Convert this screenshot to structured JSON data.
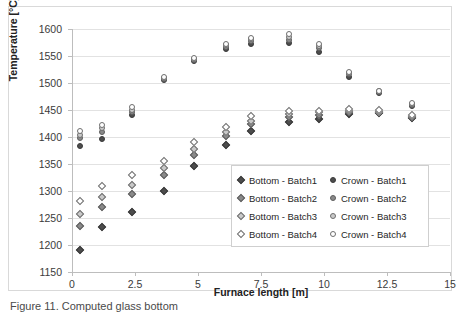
{
  "chart_data": {
    "type": "scatter",
    "title": "",
    "xlabel": "Furnace length [m]",
    "ylabel": "Temperature [°C]",
    "xlim": [
      0,
      15
    ],
    "ylim": [
      1150,
      1600
    ],
    "xticks": [
      "0",
      "2.5",
      "5",
      "7.5",
      "10",
      "12.5",
      "15"
    ],
    "xtick_values": [
      0,
      2.5,
      5,
      7.5,
      10,
      12.5,
      15
    ],
    "yticks": [
      "1150",
      "1200",
      "1250",
      "1300",
      "1350",
      "1400",
      "1450",
      "1500",
      "1550",
      "1600"
    ],
    "ytick_values": [
      1150,
      1200,
      1250,
      1300,
      1350,
      1400,
      1450,
      1500,
      1550,
      1600
    ],
    "grid": "horizontal",
    "legend_position": "center-right-inside",
    "series": [
      {
        "name": "Bottom - Batch1",
        "marker": "diamond",
        "fill": "#4d4d4d",
        "style_class": "b1",
        "x": [
          0.3,
          1.2,
          2.4,
          3.65,
          4.85,
          6.1,
          7.1,
          8.6,
          9.8,
          11.0,
          12.2,
          13.5
        ],
        "y": [
          1191,
          1234,
          1261,
          1300,
          1347,
          1385,
          1412,
          1428,
          1434,
          1443,
          1444,
          1436
        ]
      },
      {
        "name": "Bottom - Batch2",
        "marker": "diamond",
        "fill": "#8a8a8a",
        "style_class": "b2",
        "x": [
          0.3,
          1.2,
          2.4,
          3.65,
          4.85,
          6.1,
          7.1,
          8.6,
          9.8,
          11.0,
          12.2,
          13.5
        ],
        "y": [
          1235,
          1270,
          1295,
          1330,
          1367,
          1402,
          1424,
          1437,
          1440,
          1446,
          1446,
          1437
        ]
      },
      {
        "name": "Bottom - Batch3",
        "marker": "diamond",
        "fill": "#c9c9c9",
        "style_class": "b3",
        "x": [
          0.3,
          1.2,
          2.4,
          3.65,
          4.85,
          6.1,
          7.1,
          8.6,
          9.8,
          11.0,
          12.2,
          13.5
        ],
        "y": [
          1258,
          1289,
          1311,
          1342,
          1378,
          1410,
          1430,
          1443,
          1446,
          1449,
          1447,
          1438
        ]
      },
      {
        "name": "Bottom - Batch4",
        "marker": "diamond",
        "fill": "#ffffff",
        "style_class": "b4",
        "x": [
          0.3,
          1.2,
          2.4,
          3.65,
          4.85,
          6.1,
          7.1,
          8.6,
          9.8,
          11.0,
          12.2,
          13.5
        ],
        "y": [
          1281,
          1309,
          1329,
          1356,
          1390,
          1418,
          1438,
          1448,
          1449,
          1452,
          1450,
          1440
        ]
      },
      {
        "name": "Crown - Batch1",
        "marker": "circle",
        "fill": "#4d4d4d",
        "style_class": "b1",
        "x": [
          0.3,
          1.2,
          2.4,
          3.65,
          4.85,
          6.1,
          7.1,
          8.6,
          9.8,
          11.0,
          12.2,
          13.5
        ],
        "y": [
          1384,
          1397,
          1441,
          1506,
          1541,
          1563,
          1572,
          1574,
          1557,
          1512,
          1481,
          1458
        ]
      },
      {
        "name": "Crown - Batch2",
        "marker": "circle",
        "fill": "#8a8a8a",
        "style_class": "b2",
        "x": [
          0.3,
          1.2,
          2.4,
          3.65,
          4.85,
          6.1,
          7.1,
          8.6,
          9.8,
          11.0,
          12.2,
          13.5
        ],
        "y": [
          1399,
          1410,
          1446,
          1508,
          1543,
          1567,
          1577,
          1580,
          1564,
          1516,
          1483,
          1460
        ]
      },
      {
        "name": "Crown - Batch3",
        "marker": "circle",
        "fill": "#c9c9c9",
        "style_class": "b3",
        "x": [
          0.3,
          1.2,
          2.4,
          3.65,
          4.85,
          6.1,
          7.1,
          8.6,
          9.8,
          11.0,
          12.2,
          13.5
        ],
        "y": [
          1403,
          1416,
          1450,
          1510,
          1545,
          1570,
          1581,
          1585,
          1568,
          1518,
          1485,
          1461
        ]
      },
      {
        "name": "Crown - Batch4",
        "marker": "circle",
        "fill": "#ffffff",
        "style_class": "b4",
        "x": [
          0.3,
          1.2,
          2.4,
          3.65,
          4.85,
          6.1,
          7.1,
          8.6,
          9.8,
          11.0,
          12.2,
          13.5
        ],
        "y": [
          1411,
          1423,
          1456,
          1512,
          1547,
          1572,
          1583,
          1590,
          1572,
          1520,
          1486,
          1463
        ]
      }
    ]
  },
  "legend": {
    "entries": [
      {
        "label": "Bottom - Batch1",
        "marker": "diamond",
        "style_class": "b1"
      },
      {
        "label": "Crown - Batch1",
        "marker": "circle",
        "style_class": "b1"
      },
      {
        "label": "Bottom - Batch2",
        "marker": "diamond",
        "style_class": "b2"
      },
      {
        "label": "Crown - Batch2",
        "marker": "circle",
        "style_class": "b2"
      },
      {
        "label": "Bottom - Batch3",
        "marker": "diamond",
        "style_class": "b3"
      },
      {
        "label": "Crown - Batch3",
        "marker": "circle",
        "style_class": "b3"
      },
      {
        "label": "Bottom - Batch4",
        "marker": "diamond",
        "style_class": "b4"
      },
      {
        "label": "Crown - Batch4",
        "marker": "circle",
        "style_class": "b4"
      }
    ]
  },
  "caption": {
    "text": "Figure 11. Computed glass bottom"
  }
}
